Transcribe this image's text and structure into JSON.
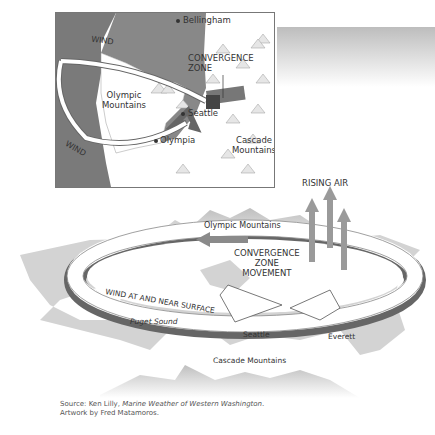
{
  "inset_map": {
    "labels": {
      "wind_top": "WIND",
      "wind_bottom": "WIND",
      "bellingham": "Bellingham",
      "convergence_zone_line1": "CONVERGENCE",
      "convergence_zone_line2": "ZONE",
      "olympic_line1": "Olympic",
      "olympic_line2": "Mountains",
      "seattle": "Seattle",
      "olympia": "Olympia",
      "cascade_line1": "Cascade",
      "cascade_line2": "Mountains"
    }
  },
  "main_diagram": {
    "labels": {
      "rising_air": "RISING AIR",
      "olympic_mountains": "Olympic Mountains",
      "czm_line1": "CONVERGENCE",
      "czm_line2": "ZONE",
      "czm_line3": "MOVEMENT",
      "wind_surface": "WIND AT AND NEAR SURFACE",
      "puget_sound": "Puget Sound",
      "seattle": "Seattle",
      "everett": "Everett",
      "cascade_mountains": "Cascade Mountains"
    }
  },
  "credits": {
    "source_prefix": "Source: Ken Lilly, ",
    "source_title": "Marine Weather of Western Washington",
    "source_suffix": ".",
    "artwork": "Artwork by Fred Matamoros."
  },
  "colors": {
    "land": "#d0d0d0",
    "water": "#7a7a7a",
    "arrow_fill": "#ffffff",
    "arrow_edge": "#666666",
    "convergence_box": "#555555",
    "rising_air": "#9a9a9a"
  }
}
